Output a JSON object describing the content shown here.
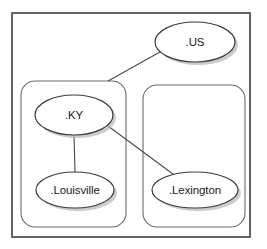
{
  "diagram": {
    "type": "node-link-graph",
    "background_color": "#ffffff",
    "frame": {
      "name": "root-frame",
      "stroke_color": "#555558",
      "x": 12,
      "y": 13,
      "width": 238,
      "height": 224
    },
    "zones": [
      {
        "id": "zone-ky",
        "label": "",
        "stroke_color": "#6a6a6e",
        "x": 21,
        "y": 81,
        "width": 105,
        "height": 146,
        "radius": 14
      },
      {
        "id": "zone-lexington",
        "label": "",
        "stroke_color": "#6a6a6e",
        "x": 143,
        "y": 85,
        "width": 102,
        "height": 142,
        "radius": 14
      }
    ],
    "nodes": [
      {
        "id": "node-us",
        "label": ".US",
        "cx": 195,
        "cy": 42,
        "rx": 40,
        "ry": 20,
        "stroke_color": "#3b3b3e",
        "fill_color": "#ffffff"
      },
      {
        "id": "node-ky",
        "label": ".KY",
        "cx": 74,
        "cy": 115,
        "rx": 39,
        "ry": 20,
        "stroke_color": "#3b3b3e",
        "fill_color": "#ffffff"
      },
      {
        "id": "node-louisville",
        "label": ".Louisville",
        "cx": 75,
        "cy": 190,
        "rx": 39,
        "ry": 18,
        "stroke_color": "#3b3b3e",
        "fill_color": "#ffffff"
      },
      {
        "id": "node-lexington",
        "label": ".Lexington",
        "cx": 195,
        "cy": 190,
        "rx": 43,
        "ry": 18,
        "stroke_color": "#3b3b3e",
        "fill_color": "#ffffff"
      }
    ],
    "edges": [
      {
        "id": "edge-us-to-zone-ky",
        "from": "node-us",
        "to": "zone-ky",
        "x1": 160,
        "y1": 52,
        "x2": 108,
        "y2": 81,
        "stroke_color": "#4a4a4d"
      },
      {
        "id": "edge-ky-to-louisville",
        "from": "node-ky",
        "to": "node-louisville",
        "x1": 74,
        "y1": 135,
        "x2": 75,
        "y2": 172,
        "stroke_color": "#4a4a4d"
      },
      {
        "id": "edge-ky-to-lexington",
        "from": "node-ky",
        "to": "node-lexington",
        "x1": 108,
        "y1": 126,
        "x2": 177,
        "y2": 177,
        "stroke_color": "#4a4a4d"
      }
    ]
  }
}
